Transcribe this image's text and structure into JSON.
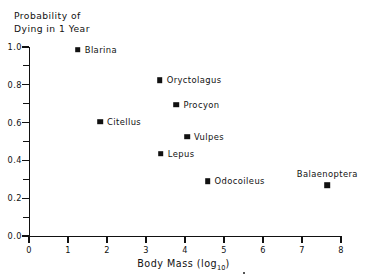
{
  "chart_data": {
    "type": "scatter",
    "title": "",
    "ylabel": "Probability of\nDying in 1 Year",
    "xlabel": "Body Mass (log",
    "xlabel_subscript": "10",
    "xlabel_suffix": ")",
    "xlim": [
      0,
      8
    ],
    "ylim": [
      0.0,
      1.0
    ],
    "grid": false,
    "legend": "none",
    "xticks": [
      0,
      1,
      2,
      3,
      4,
      5,
      6,
      7,
      8
    ],
    "xticklabels": [
      "0",
      "1",
      "2",
      "3",
      "4",
      "5",
      "6",
      "7",
      "8"
    ],
    "yticks": [
      0.0,
      0.2,
      0.4,
      0.6,
      0.8,
      1.0
    ],
    "yticklabels": [
      "0.0",
      "0.2",
      "0.4",
      "0.6",
      "0.8",
      "1.0"
    ],
    "yminorticks": [
      0.1,
      0.3,
      0.5,
      0.7,
      0.9
    ],
    "marker": "square",
    "marker_color": "#111111",
    "points": [
      {
        "label": "Blarina",
        "x": 1.25,
        "y": 0.985,
        "label_pos": "right"
      },
      {
        "label": "Oryctolagus",
        "x": 3.35,
        "y": 0.825,
        "label_pos": "right"
      },
      {
        "label": "Procyon",
        "x": 3.78,
        "y": 0.695,
        "label_pos": "right"
      },
      {
        "label": "Citellus",
        "x": 1.82,
        "y": 0.605,
        "label_pos": "right"
      },
      {
        "label": "Vulpes",
        "x": 4.05,
        "y": 0.525,
        "label_pos": "right"
      },
      {
        "label": "Lepus",
        "x": 3.38,
        "y": 0.435,
        "label_pos": "right"
      },
      {
        "label": "Odocoileus",
        "x": 4.58,
        "y": 0.29,
        "label_pos": "right"
      },
      {
        "label": "Balaenoptera",
        "x": 7.65,
        "y": 0.27,
        "label_pos": "above"
      }
    ]
  }
}
